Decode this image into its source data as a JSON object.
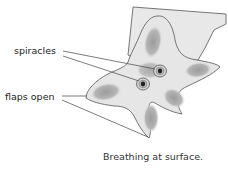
{
  "diagram": {
    "labels": {
      "spiracles": "spiracles",
      "flaps_open": "flaps open"
    },
    "caption": "Breathing at surface.",
    "colors": {
      "body_fill": "#e6e6e6",
      "arm_shading": "#a8a8a8",
      "outline": "#555555",
      "leader_line": "#444444",
      "spiracle_dark": "#222222",
      "background_tissue": "#e8e8e8"
    }
  }
}
